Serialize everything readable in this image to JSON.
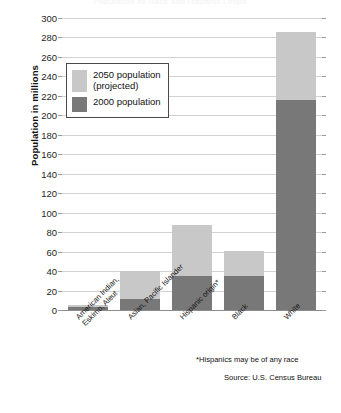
{
  "title": "Population by Race and Hispanic Origin",
  "colors": {
    "projected_2050": "#c8c8c8",
    "population_2000": "#787878",
    "gridline": "#d2d2d2",
    "axis": "#8c8c8c",
    "text": "#111111"
  },
  "legend": {
    "position": "inside-top-left",
    "entries": [
      {
        "label": "2050 population\n(projected)",
        "color_key": "projected_2050"
      },
      {
        "label": "2000 population",
        "color_key": "population_2000"
      }
    ]
  },
  "footnotes": {
    "race": "*Hispanics may be of any race",
    "source": "Source: U.S. Census Bureau"
  },
  "chart_data": {
    "type": "bar",
    "stacked": true,
    "title": "Population by Race and Hispanic Origin",
    "subtitle": "",
    "xlabel": "",
    "ylabel": "Population in millions",
    "ylim": [
      0,
      300
    ],
    "ytick_step": 20,
    "yticks": [
      0,
      20,
      40,
      60,
      80,
      100,
      120,
      140,
      160,
      180,
      200,
      220,
      240,
      260,
      280,
      300
    ],
    "ytick_labels": [
      "0",
      "20",
      "40",
      "60",
      "80",
      "100",
      "120",
      "140",
      "160",
      "180",
      "200",
      "220",
      "240",
      "260",
      "280",
      "300"
    ],
    "grid": true,
    "grid_axis": "y",
    "legend_entries": [
      "2050 population (projected)",
      "2000 population"
    ],
    "categories": [
      "American Indian,\nEskimo, Aleut",
      "Asian, Pacific Islander",
      "Hispanic origin*",
      "Black",
      "White"
    ],
    "series": [
      {
        "name": "2000 population",
        "color": "#787878",
        "values": [
          3,
          11,
          35,
          35,
          216
        ]
      },
      {
        "name": "2050 population (projected)",
        "color": "#c8c8c8",
        "note": "segment drawn above the 2000 value; values below are the projected totals",
        "totals": [
          5,
          40,
          87,
          61,
          286
        ],
        "values": [
          2,
          29,
          52,
          26,
          70
        ]
      }
    ]
  }
}
